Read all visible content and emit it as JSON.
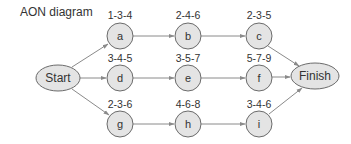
{
  "title": "AON diagram",
  "colors": {
    "node_fill": "#e4e4e4",
    "node_stroke": "#6b6b6b",
    "edge": "#8a8a8a",
    "text": "#333333"
  },
  "nodes": {
    "start": {
      "label": "Start"
    },
    "a": {
      "label": "a",
      "time": "1-3-4"
    },
    "b": {
      "label": "b",
      "time": "2-4-6"
    },
    "c": {
      "label": "c",
      "time": "2-3-5"
    },
    "d": {
      "label": "d",
      "time": "3-4-5"
    },
    "e": {
      "label": "e",
      "time": "3-5-7"
    },
    "f": {
      "label": "f",
      "time": "5-7-9"
    },
    "g": {
      "label": "g",
      "time": "2-3-6"
    },
    "h": {
      "label": "h",
      "time": "4-6-8"
    },
    "i": {
      "label": "i",
      "time": "3-4-6"
    },
    "finish": {
      "label": "Finish"
    }
  },
  "edges": [
    [
      "Start",
      "a"
    ],
    [
      "Start",
      "d"
    ],
    [
      "Start",
      "g"
    ],
    [
      "a",
      "b"
    ],
    [
      "b",
      "c"
    ],
    [
      "c",
      "Finish"
    ],
    [
      "d",
      "e"
    ],
    [
      "e",
      "f"
    ],
    [
      "f",
      "Finish"
    ],
    [
      "g",
      "h"
    ],
    [
      "h",
      "i"
    ],
    [
      "i",
      "Finish"
    ]
  ]
}
